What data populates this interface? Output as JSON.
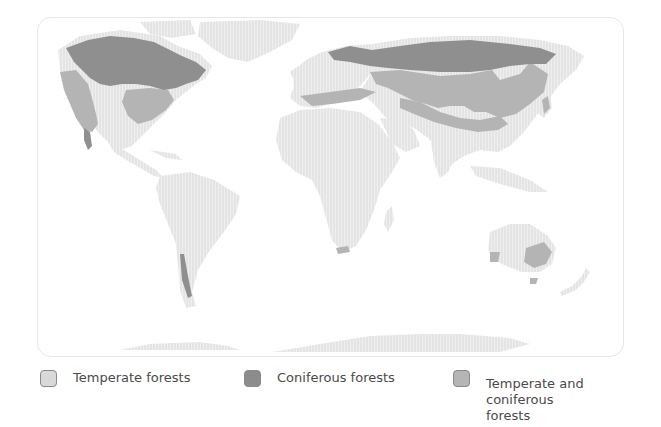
{
  "map": {
    "title": "World forest distribution",
    "colors": {
      "land": "#e9e9e9",
      "temperate_forests": "#d6d6d6",
      "coniferous_forests": "#8f8f8f",
      "temperate_and_coniferous_forests": "#b4b4b4",
      "frame_border": "#e6e6e6"
    }
  },
  "legend": {
    "items": [
      {
        "label": "Temperate forests",
        "color": "#d9d9d9",
        "icon": "swatch-light"
      },
      {
        "label": "Coniferous forests",
        "color": "#8c8c8c",
        "icon": "swatch-dark"
      },
      {
        "label": "Temperate and coniferous forests",
        "label_line1": "Temperate and",
        "label_line2": "coniferous forests",
        "color": "#b5b5b5",
        "icon": "swatch-medium"
      }
    ]
  }
}
